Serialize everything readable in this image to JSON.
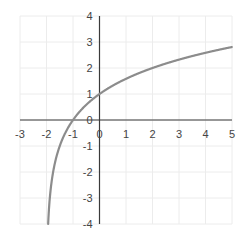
{
  "chart_data": {
    "type": "line",
    "title": "",
    "xlabel": "",
    "ylabel": "",
    "function": "y = log2(x + 2)",
    "xlim": [
      -3,
      5
    ],
    "ylim": [
      -4,
      4
    ],
    "grid": true,
    "legend": null,
    "x_ticks": [
      "-3",
      "-2",
      "-1",
      "0",
      "1",
      "2",
      "3",
      "4",
      "5"
    ],
    "y_ticks": [
      "4",
      "3",
      "2",
      "1",
      "0",
      "-1",
      "-2",
      "-3",
      "-4"
    ],
    "series": [
      {
        "name": "curve",
        "color": "#8c8c8c",
        "x": [
          -1.9375,
          -1.875,
          -1.75,
          -1.5,
          -1.25,
          -1,
          -0.5,
          0,
          0.5,
          1,
          1.5,
          2,
          2.5,
          3,
          3.5,
          4,
          4.5,
          5
        ],
        "y": [
          -4,
          -3,
          -2,
          -1,
          -0.415,
          0,
          0.585,
          1,
          1.322,
          1.585,
          1.807,
          2,
          2.17,
          2.322,
          2.459,
          2.585,
          2.7,
          2.807
        ]
      }
    ]
  },
  "colors": {
    "grid": "#ececec",
    "axis": "#3a3a3a",
    "curve": "#8c8c8c",
    "tick_text": "#444444"
  }
}
